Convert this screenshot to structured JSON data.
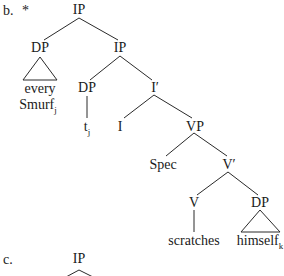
{
  "examples": [
    {
      "marker": "b.",
      "judgment": "*",
      "nodes": {
        "root": "IP",
        "dp_subject": "DP",
        "dp_subject_content_line1": "every",
        "dp_subject_content_line2": "Smurf",
        "dp_subject_index": "j",
        "ip_inner": "IP",
        "dp_trace": "DP",
        "trace": "t",
        "trace_index": "j",
        "i_bar": "I′",
        "i_head": "I",
        "vp": "VP",
        "spec": "Spec",
        "v_bar": "V′",
        "v_head": "V",
        "verb": "scratches",
        "dp_object": "DP",
        "dp_object_content": "himself",
        "dp_object_index": "k"
      }
    },
    {
      "marker": "c.",
      "nodes": {
        "root": "IP"
      }
    }
  ]
}
